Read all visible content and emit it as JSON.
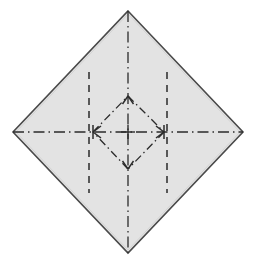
{
  "figure": {
    "type": "origami-crease-pattern",
    "canvas": {
      "width": 255,
      "height": 266
    },
    "colors": {
      "paper_fill": "#e3e3e3",
      "paper_outline": "#4a4a4a",
      "crease_line": "#2b2b2b",
      "background": "#ffffff"
    },
    "outer_diamond": {
      "name": "paper-sheet",
      "description": "square sheet rotated 45 degrees",
      "vertices": [
        {
          "label": "top",
          "x": 128,
          "y": 11
        },
        {
          "label": "right",
          "x": 243,
          "y": 132
        },
        {
          "label": "bottom",
          "x": 128,
          "y": 253
        },
        {
          "label": "left",
          "x": 13,
          "y": 132
        }
      ],
      "stroke_width": 1.6
    },
    "inner_diamond": {
      "name": "blintz-fold-diamond",
      "description": "inner dash-dot diamond connecting midpoints of fold quadrants",
      "vertices": [
        {
          "label": "top",
          "x": 128,
          "y": 96
        },
        {
          "label": "right",
          "x": 164,
          "y": 132
        },
        {
          "label": "bottom",
          "x": 128,
          "y": 169
        },
        {
          "label": "left",
          "x": 93,
          "y": 132
        }
      ],
      "line_style": "dash-dot",
      "stroke_width": 1.3
    },
    "axes": [
      {
        "name": "vertical-center-axis",
        "line_style": "dash-dot",
        "x1": 128,
        "y1": 11,
        "x2": 128,
        "y2": 253,
        "stroke_width": 1.3
      },
      {
        "name": "horizontal-center-axis",
        "line_style": "dash-dot",
        "x1": 13,
        "y1": 132,
        "x2": 243,
        "y2": 132,
        "stroke_width": 1.3
      }
    ],
    "dashed_fold_lines": [
      {
        "name": "left-vertical-fold-line",
        "line_style": "dashed",
        "x1": 89,
        "y1": 72,
        "x2": 89,
        "y2": 193,
        "stroke_width": 1.5
      },
      {
        "name": "right-vertical-fold-line",
        "line_style": "dashed",
        "x1": 167,
        "y1": 72,
        "x2": 167,
        "y2": 193,
        "stroke_width": 1.5
      }
    ],
    "arrowheads": [
      {
        "name": "arrow-up",
        "direction": "up",
        "x": 128,
        "y": 96
      },
      {
        "name": "arrow-right",
        "direction": "right",
        "x": 164,
        "y": 132
      },
      {
        "name": "arrow-down",
        "direction": "down",
        "x": 128,
        "y": 169
      },
      {
        "name": "arrow-left",
        "direction": "left",
        "x": 93,
        "y": 132
      }
    ],
    "center_mark": {
      "name": "center-crosshair",
      "x": 128,
      "y": 132,
      "arm_length": 7
    }
  }
}
